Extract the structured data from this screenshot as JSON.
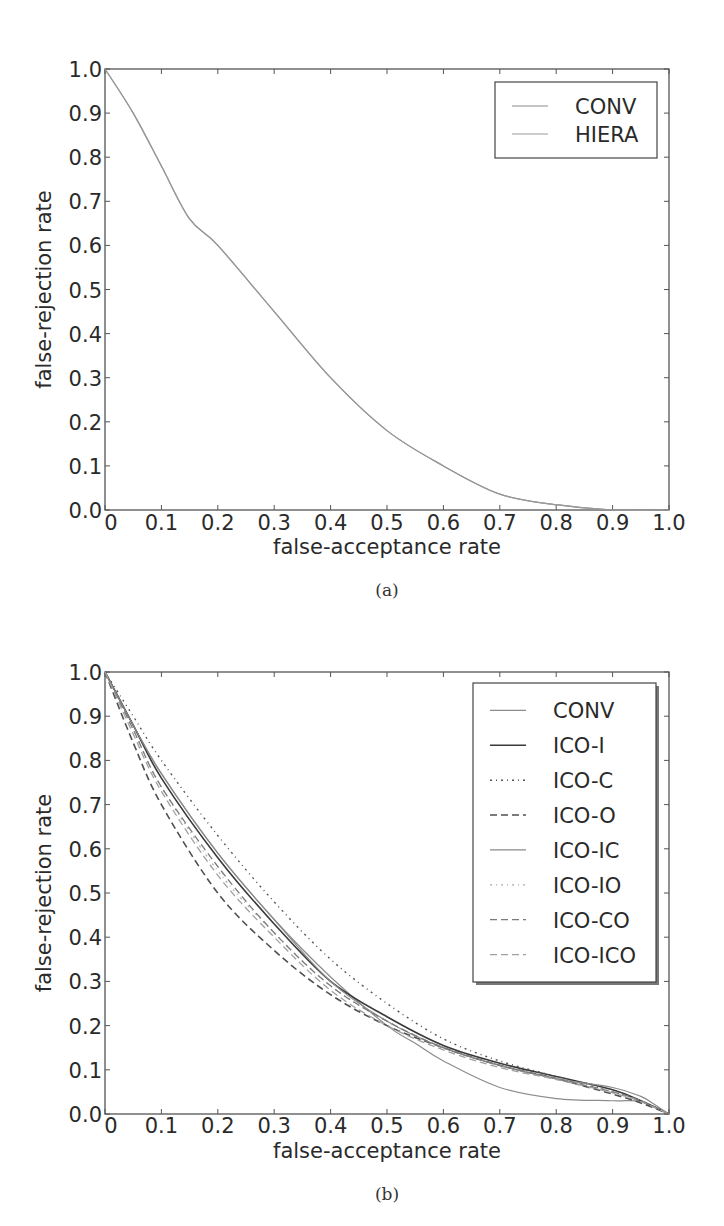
{
  "chart_data": [
    {
      "id": "a",
      "type": "line",
      "caption": "(a)",
      "title": "",
      "xlabel": "false-acceptance rate",
      "ylabel": "false-rejection rate",
      "xlim": [
        0,
        1.0
      ],
      "ylim": [
        0,
        1.0
      ],
      "grid": false,
      "xticks": [
        "0",
        "0.1",
        "0.2",
        "0.3",
        "0.4",
        "0.5",
        "0.6",
        "0.7",
        "0.8",
        "0.9",
        "1.0"
      ],
      "yticks": [
        "0.0",
        "0.1",
        "0.2",
        "0.3",
        "0.4",
        "0.5",
        "0.6",
        "0.7",
        "0.8",
        "0.9",
        "1.0"
      ],
      "legend_position": "upper right",
      "plot_box": {
        "x": 105,
        "y": 69,
        "w": 564,
        "h": 441
      },
      "legend_box": {
        "x": 495,
        "y": 82,
        "w": 162,
        "h": 76,
        "shadow": false
      },
      "series": [
        {
          "name": "CONV",
          "style": "solid",
          "color": "#8a8a8a",
          "width": 1.2,
          "x": [
            0,
            0.05,
            0.1,
            0.15,
            0.2,
            0.3,
            0.4,
            0.5,
            0.6,
            0.7,
            0.8,
            0.9,
            1.0
          ],
          "y": [
            1.0,
            0.9,
            0.78,
            0.66,
            0.6,
            0.45,
            0.3,
            0.18,
            0.1,
            0.036,
            0.012,
            0.0,
            0.0
          ]
        },
        {
          "name": "HIERA",
          "style": "solid",
          "color": "#9a9a9a",
          "width": 1.2,
          "x": [
            0,
            0.05,
            0.1,
            0.15,
            0.2,
            0.3,
            0.4,
            0.5,
            0.6,
            0.7,
            0.8,
            0.9,
            1.0
          ],
          "y": [
            1.0,
            0.9,
            0.78,
            0.66,
            0.6,
            0.45,
            0.3,
            0.18,
            0.1,
            0.036,
            0.012,
            0.0,
            0.0
          ]
        }
      ],
      "label_pos": {
        "tick_y": 530,
        "xlabel_y": 554,
        "caption_y": 596,
        "ylabel_x": 44
      }
    },
    {
      "id": "b",
      "type": "line",
      "caption": "(b)",
      "title": "",
      "xlabel": "false-acceptance rate",
      "ylabel": "false-rejection rate",
      "xlim": [
        0,
        1.0
      ],
      "ylim": [
        0,
        1.0
      ],
      "grid": false,
      "xticks": [
        "0",
        "0.1",
        "0.2",
        "0.3",
        "0.4",
        "0.5",
        "0.6",
        "0.7",
        "0.8",
        "0.9",
        "1.0"
      ],
      "yticks": [
        "0.0",
        "0.1",
        "0.2",
        "0.3",
        "0.4",
        "0.5",
        "0.6",
        "0.7",
        "0.8",
        "0.9",
        "1.0"
      ],
      "legend_position": "upper right",
      "plot_box": {
        "x": 105,
        "y": 672,
        "w": 564,
        "h": 442
      },
      "legend_box": {
        "x": 473,
        "y": 683,
        "w": 183,
        "h": 299,
        "shadow": true
      },
      "series": [
        {
          "name": "CONV",
          "style": "solid",
          "color": "#8c8c8c",
          "width": 1.2,
          "x": [
            0,
            0.05,
            0.1,
            0.2,
            0.3,
            0.4,
            0.5,
            0.55,
            0.6,
            0.7,
            0.8,
            0.9,
            0.95,
            1.0
          ],
          "y": [
            1.0,
            0.88,
            0.77,
            0.59,
            0.44,
            0.31,
            0.2,
            0.16,
            0.12,
            0.06,
            0.035,
            0.03,
            0.028,
            0.0
          ]
        },
        {
          "name": "ICO-I",
          "style": "solid",
          "color": "#3a3a3a",
          "width": 1.6,
          "x": [
            0,
            0.05,
            0.1,
            0.2,
            0.3,
            0.4,
            0.5,
            0.6,
            0.7,
            0.8,
            0.9,
            0.95,
            1.0
          ],
          "y": [
            1.0,
            0.88,
            0.76,
            0.58,
            0.43,
            0.3,
            0.22,
            0.155,
            0.115,
            0.085,
            0.055,
            0.03,
            0.0
          ]
        },
        {
          "name": "ICO-C",
          "style": "dashdot",
          "color": "#555555",
          "width": 1.4,
          "x": [
            0,
            0.05,
            0.1,
            0.2,
            0.3,
            0.4,
            0.5,
            0.6,
            0.7,
            0.8,
            0.9,
            0.95,
            1.0
          ],
          "y": [
            1.0,
            0.9,
            0.8,
            0.63,
            0.48,
            0.35,
            0.25,
            0.17,
            0.12,
            0.085,
            0.05,
            0.03,
            0.0
          ]
        },
        {
          "name": "ICO-O",
          "style": "dashed",
          "color": "#505050",
          "width": 1.6,
          "x": [
            0,
            0.05,
            0.1,
            0.2,
            0.3,
            0.4,
            0.5,
            0.6,
            0.7,
            0.8,
            0.9,
            0.95,
            1.0
          ],
          "y": [
            1.0,
            0.84,
            0.7,
            0.5,
            0.37,
            0.27,
            0.2,
            0.15,
            0.11,
            0.08,
            0.045,
            0.025,
            0.0
          ]
        },
        {
          "name": "ICO-IC",
          "style": "solid",
          "color": "#8a8a8a",
          "width": 1.2,
          "x": [
            0,
            0.05,
            0.1,
            0.2,
            0.3,
            0.4,
            0.5,
            0.6,
            0.7,
            0.8,
            0.9,
            0.95,
            0.97,
            1.0
          ],
          "y": [
            1.0,
            0.88,
            0.77,
            0.59,
            0.44,
            0.3,
            0.21,
            0.15,
            0.11,
            0.08,
            0.06,
            0.04,
            0.025,
            0.0
          ]
        },
        {
          "name": "ICO-IO",
          "style": "dashdot",
          "color": "#aaaaaa",
          "width": 1.2,
          "x": [
            0,
            0.05,
            0.1,
            0.2,
            0.3,
            0.4,
            0.5,
            0.6,
            0.7,
            0.8,
            0.9,
            0.95,
            1.0
          ],
          "y": [
            1.0,
            0.87,
            0.74,
            0.55,
            0.41,
            0.29,
            0.21,
            0.15,
            0.11,
            0.08,
            0.05,
            0.03,
            0.0
          ]
        },
        {
          "name": "ICO-CO",
          "style": "dashed",
          "color": "#7a7a7a",
          "width": 1.3,
          "x": [
            0,
            0.05,
            0.1,
            0.2,
            0.3,
            0.4,
            0.5,
            0.6,
            0.7,
            0.8,
            0.9,
            0.95,
            1.0
          ],
          "y": [
            1.0,
            0.87,
            0.74,
            0.56,
            0.41,
            0.29,
            0.21,
            0.15,
            0.11,
            0.08,
            0.05,
            0.03,
            0.0
          ]
        },
        {
          "name": "ICO-ICO",
          "style": "dashed",
          "color": "#a0a0a0",
          "width": 1.3,
          "x": [
            0,
            0.05,
            0.1,
            0.2,
            0.3,
            0.4,
            0.5,
            0.6,
            0.7,
            0.8,
            0.9,
            0.95,
            1.0
          ],
          "y": [
            1.0,
            0.86,
            0.73,
            0.54,
            0.4,
            0.28,
            0.2,
            0.145,
            0.105,
            0.078,
            0.048,
            0.028,
            0.0
          ]
        }
      ],
      "label_pos": {
        "tick_y": 1133,
        "xlabel_y": 1158,
        "caption_y": 1200,
        "ylabel_x": 44
      }
    }
  ]
}
